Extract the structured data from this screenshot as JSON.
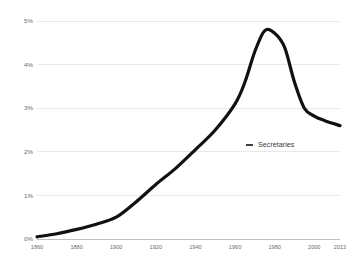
{
  "chart_data": {
    "type": "line",
    "title": "",
    "xlabel": "",
    "ylabel": "",
    "grid": true,
    "legend_position": "inside-right",
    "xlim": [
      1860,
      2013
    ],
    "ylim": [
      0,
      5
    ],
    "y_tick_labels": [
      "5%",
      "4%",
      "3%",
      "2%",
      "1%",
      "0%"
    ],
    "y_tick_values": [
      5,
      4,
      3,
      2,
      1,
      0
    ],
    "x_tick_labels": [
      "1860",
      "1880",
      "1900",
      "1920",
      "1940",
      "1960",
      "1980",
      "2000",
      "2013"
    ],
    "x_tick_values": [
      1860,
      1880,
      1900,
      1920,
      1940,
      1960,
      1980,
      2000,
      2013
    ],
    "series": [
      {
        "name": "Secretaries",
        "color": "#111111",
        "x": [
          1860,
          1870,
          1880,
          1890,
          1900,
          1910,
          1920,
          1930,
          1940,
          1950,
          1960,
          1965,
          1970,
          1975,
          1980,
          1985,
          1990,
          1995,
          2000,
          2005,
          2013
        ],
        "values": [
          0.05,
          0.12,
          0.22,
          0.34,
          0.5,
          0.85,
          1.25,
          1.62,
          2.05,
          2.5,
          3.1,
          3.6,
          4.3,
          4.78,
          4.72,
          4.4,
          3.6,
          3.0,
          2.82,
          2.72,
          2.6
        ]
      }
    ],
    "legend": [
      {
        "label": "Secretaries",
        "marker": "dash",
        "color": "#111111"
      }
    ]
  }
}
